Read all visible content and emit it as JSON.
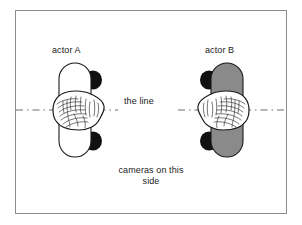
{
  "diagram": {
    "title_present": false,
    "frame": {
      "border_color": "#8d8d8d",
      "background_color": "#ffffff"
    },
    "labels": {
      "actor_a": "actor A",
      "actor_b": "actor B",
      "the_line": "the line",
      "cameras": "cameras on this side"
    },
    "axis_line": {
      "style": "dash-dot",
      "color": "#6e6e6e",
      "orientation": "horizontal",
      "y_position": 110
    },
    "actors": [
      {
        "id": "actor-a",
        "label": "actor A",
        "body_fill": "#ffffff",
        "body_stroke": "#1a1a1a",
        "shoulder_fill": "#111111",
        "shoulder_side": "right",
        "head_fill": "#ffffff",
        "head_stroke": "#1a1a1a",
        "facing": "right",
        "cx": 78,
        "cy": 110
      },
      {
        "id": "actor-b",
        "label": "actor B",
        "body_fill": "#8a8a8a",
        "body_stroke": "#1a1a1a",
        "shoulder_fill": "#111111",
        "shoulder_side": "left",
        "head_fill": "#ffffff",
        "head_stroke": "#1a1a1a",
        "facing": "left",
        "cx": 226,
        "cy": 110
      }
    ],
    "colors": {
      "ink": "#1a1a1a",
      "gray_body": "#8a8a8a",
      "black_shoulder": "#111111",
      "line_gray": "#6e6e6e",
      "frame_gray": "#8d8d8d"
    }
  }
}
